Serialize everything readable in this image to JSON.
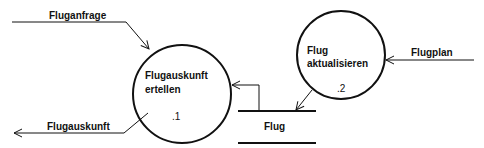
{
  "diagram": {
    "processes": [
      {
        "id": "1",
        "line1": "Flugauskunft",
        "line2": "ertellen",
        "number": ".1"
      },
      {
        "id": "2",
        "line1": "Flug",
        "line2": "aktualisieren",
        "number": ".2"
      }
    ],
    "store": {
      "label": "Flug"
    },
    "flows": {
      "request": "Fluganfrage",
      "response": "Flugauskunft",
      "schedule": "Flugplan"
    }
  }
}
